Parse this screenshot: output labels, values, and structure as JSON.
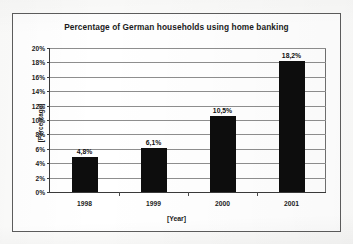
{
  "chart_data": {
    "type": "bar",
    "title": "Percentage of German households using home banking",
    "xlabel": "[Year]",
    "ylabel": "[Percentage]",
    "categories": [
      "1998",
      "1999",
      "2000",
      "2001"
    ],
    "values": [
      4.8,
      6.1,
      10.5,
      18.2
    ],
    "value_labels": [
      "4,8%",
      "6,1%",
      "10,5%",
      "18,2%"
    ],
    "ylim": [
      0,
      20
    ],
    "ytick_step": 2,
    "ytick_labels": [
      "20%",
      "18%",
      "16%",
      "14%",
      "12%",
      "10%",
      "8%",
      "6%",
      "4%",
      "2%",
      "0%"
    ],
    "ytick_values": [
      20,
      18,
      16,
      14,
      12,
      10,
      8,
      6,
      4,
      2,
      0
    ],
    "grid": true,
    "legend": false,
    "series": [
      {
        "name": "Percentage of German households using home banking",
        "values": [
          4.8,
          6.1,
          10.5,
          18.2
        ],
        "color": "#0d0d0d"
      }
    ],
    "colors": {
      "bar": "#0d0d0d",
      "gridline": "#8e8e8e",
      "axis": "#3a3a3a",
      "frame": "#5d5d5d",
      "text": "#1b1b1b",
      "plot_background": "#ffffff",
      "page_background": "#fcfcfb"
    }
  }
}
